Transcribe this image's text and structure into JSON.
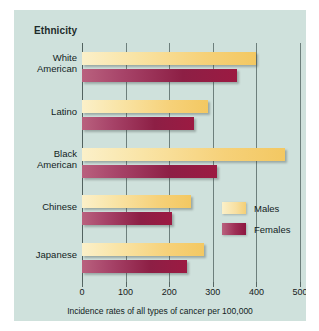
{
  "panel": {
    "background_color": "#cfe1dc",
    "title": "Ethnicity"
  },
  "legend": {
    "position": "inside-right",
    "entries": [
      {
        "label": "Males",
        "color": "#f6d179"
      },
      {
        "label": "Females",
        "color": "#9c1a42"
      }
    ]
  },
  "axis": {
    "x_title": "Incidence rates of all types of cancer per 100,000",
    "ticks": [
      "0",
      "100",
      "200",
      "300",
      "400",
      "500"
    ],
    "tick_values": [
      0,
      100,
      200,
      300,
      400,
      500
    ],
    "xlim": [
      0,
      500
    ]
  },
  "categories": [
    {
      "line1": "White",
      "line2": "American"
    },
    {
      "line1": "Latino",
      "line2": ""
    },
    {
      "line1": "Black",
      "line2": "American"
    },
    {
      "line1": "Chinese",
      "line2": ""
    },
    {
      "line1": "Japanese",
      "line2": ""
    }
  ],
  "chart_data": {
    "type": "bar",
    "orientation": "horizontal",
    "title": "Ethnicity",
    "xlabel": "Incidence rates of all types of cancer per 100,000",
    "ylabel": "Ethnicity",
    "categories": [
      "White American",
      "Latino",
      "Black American",
      "Chinese",
      "Japanese"
    ],
    "series": [
      {
        "name": "Males",
        "color": "#f6d179",
        "values": [
          400,
          290,
          465,
          250,
          280
        ]
      },
      {
        "name": "Females",
        "color": "#9c1a42",
        "values": [
          355,
          257,
          310,
          207,
          240
        ]
      }
    ],
    "xlim": [
      0,
      500
    ],
    "xticks": [
      0,
      100,
      200,
      300,
      400,
      500
    ],
    "grid": "vertical",
    "legend_position": "inside-right",
    "units": "cases per 100,000"
  }
}
